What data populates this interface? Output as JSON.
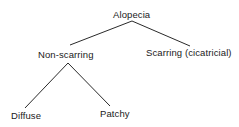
{
  "diagram": {
    "type": "tree",
    "root": {
      "label": "Alopecia",
      "children": [
        {
          "label": "Non-scarring",
          "children": [
            {
              "label": "Diffuse"
            },
            {
              "label": "Patchy"
            }
          ]
        },
        {
          "label": "Scarring (cicatricial)"
        }
      ]
    },
    "line_color": "#2a2a2a",
    "text_color": "#1a1a1a"
  }
}
